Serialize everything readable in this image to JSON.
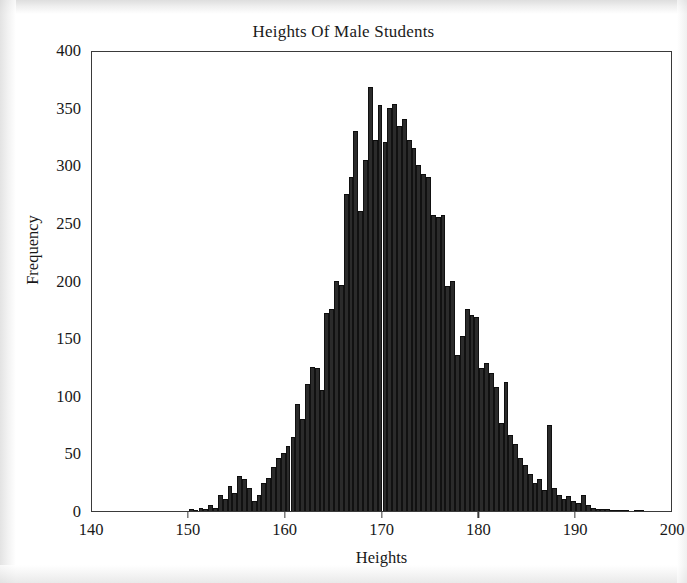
{
  "figure": {
    "background_color": "#ffffff",
    "frame_color": "#3a3a3a",
    "bar_color": "#2b2b2b"
  },
  "axis_titles": {
    "x": "Heights",
    "y": "Frequency"
  },
  "chart_data": {
    "type": "bar",
    "title": "Heights Of Male Students",
    "xlabel": "Heights",
    "ylabel": "Frequency",
    "xlim": [
      140,
      200
    ],
    "ylim": [
      0,
      400
    ],
    "xticks": [
      140,
      150,
      160,
      170,
      180,
      190,
      200
    ],
    "xtick_labels": [
      "140",
      "150",
      "160",
      "170",
      "180",
      "190",
      "200"
    ],
    "yticks": [
      0,
      50,
      100,
      150,
      200,
      250,
      300,
      350,
      400
    ],
    "ytick_labels": [
      "0",
      "50",
      "100",
      "150",
      "200",
      "250",
      "300",
      "350",
      "400"
    ],
    "grid": false,
    "legend": false,
    "bin_width": 0.5,
    "bin_starts": [
      150.0,
      150.5,
      151.0,
      151.5,
      152.0,
      152.5,
      153.0,
      153.5,
      154.0,
      154.5,
      155.0,
      155.5,
      156.0,
      156.5,
      157.0,
      157.5,
      158.0,
      158.5,
      159.0,
      159.5,
      160.0,
      160.5,
      161.0,
      161.5,
      162.0,
      162.5,
      163.0,
      163.5,
      164.0,
      164.5,
      165.0,
      165.5,
      166.0,
      166.5,
      167.0,
      167.5,
      168.0,
      168.5,
      169.0,
      169.5,
      170.0,
      170.5,
      171.0,
      171.5,
      172.0,
      172.5,
      173.0,
      173.5,
      174.0,
      174.5,
      175.0,
      175.5,
      176.0,
      176.5,
      177.0,
      177.5,
      178.0,
      178.5,
      179.0,
      179.5,
      180.0,
      180.5,
      181.0,
      181.5,
      182.0,
      182.5,
      183.0,
      183.5,
      184.0,
      184.5,
      185.0,
      185.5,
      186.0,
      186.5,
      187.0,
      187.5,
      188.0,
      188.5,
      189.0,
      189.5,
      190.0,
      190.5,
      191.0,
      191.5,
      192.0,
      192.5,
      193.0,
      193.5,
      194.0,
      194.5,
      195.0,
      195.5,
      196.0,
      196.5
    ],
    "values": [
      2,
      1,
      3,
      2,
      5,
      3,
      14,
      10,
      22,
      16,
      30,
      28,
      20,
      9,
      14,
      24,
      29,
      38,
      46,
      50,
      56,
      64,
      93,
      80,
      110,
      125,
      124,
      105,
      172,
      175,
      200,
      196,
      275,
      290,
      330,
      260,
      305,
      368,
      322,
      352,
      320,
      350,
      353,
      334,
      340,
      322,
      315,
      300,
      292,
      290,
      257,
      255,
      257,
      195,
      200,
      135,
      152,
      175,
      170,
      168,
      124,
      128,
      120,
      108,
      76,
      112,
      66,
      58,
      46,
      40,
      32,
      24,
      28,
      18,
      75,
      20,
      14,
      10,
      13,
      9,
      7,
      14,
      5,
      3,
      2,
      2,
      2,
      1,
      1,
      1,
      1,
      0,
      1,
      1
    ]
  }
}
